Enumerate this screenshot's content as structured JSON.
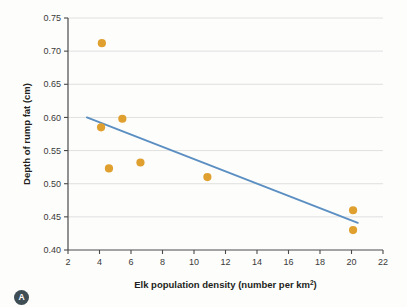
{
  "figure": {
    "panel_label": "A",
    "background_color": "#fdfdfc"
  },
  "chart_data": {
    "type": "scatter",
    "title": "",
    "xlabel": "Elk population density (number per km²)",
    "xlabel_base": "Elk population density (number per km",
    "xlabel_sup": "2",
    "xlabel_tail": ")",
    "ylabel": "Depth of rump fat (cm)",
    "xlim": [
      2,
      22
    ],
    "ylim": [
      0.4,
      0.75
    ],
    "xticks": [
      2,
      4,
      6,
      8,
      10,
      12,
      14,
      16,
      18,
      20,
      22
    ],
    "xtick_labels": [
      "2",
      "4",
      "6",
      "8",
      "10",
      "12",
      "14",
      "16",
      "18",
      "20",
      "22"
    ],
    "yticks": [
      0.4,
      0.45,
      0.5,
      0.55,
      0.6,
      0.65,
      0.7,
      0.75
    ],
    "ytick_labels": [
      "0.40",
      "0.45",
      "0.50",
      "0.55",
      "0.60",
      "0.65",
      "0.70",
      "0.75"
    ],
    "grid": "horizontal",
    "legend": "none",
    "point_color": "#e0a030",
    "line_color": "#5b8fc2",
    "grid_color": "#d8d8d8",
    "axis_color": "#4a4a4a",
    "points": [
      {
        "x": 4.15,
        "y": 0.712
      },
      {
        "x": 4.1,
        "y": 0.585
      },
      {
        "x": 5.45,
        "y": 0.598
      },
      {
        "x": 4.6,
        "y": 0.523
      },
      {
        "x": 6.6,
        "y": 0.532
      },
      {
        "x": 10.85,
        "y": 0.51
      },
      {
        "x": 20.1,
        "y": 0.46
      },
      {
        "x": 20.1,
        "y": 0.43
      }
    ],
    "trendline": {
      "x0": 3.2,
      "y0": 0.6,
      "x1": 20.4,
      "y1": 0.441
    }
  }
}
